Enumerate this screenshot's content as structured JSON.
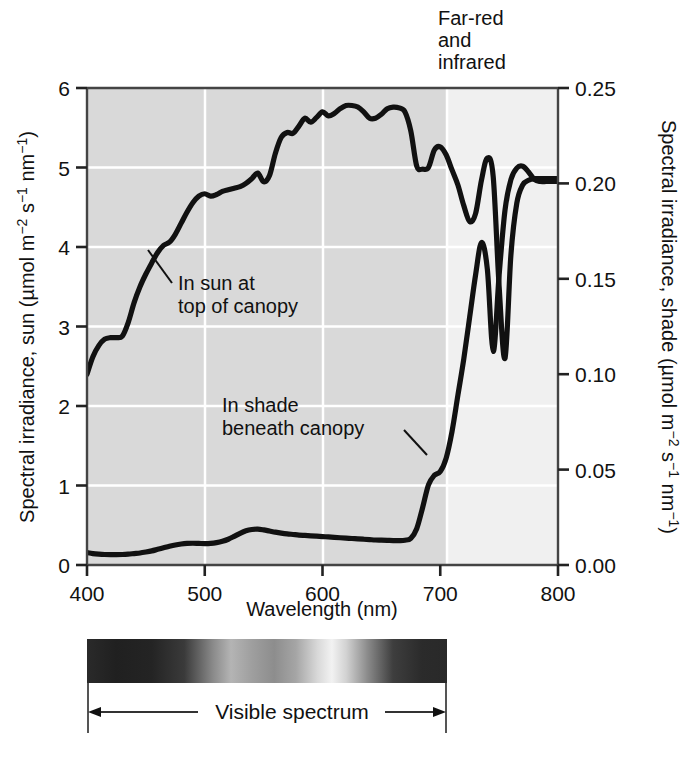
{
  "figure": {
    "background_color": "#ffffff",
    "plot_shaded_color": "#d8d8d8",
    "plot_light_color": "#f0f0f0",
    "curve_color": "#111111",
    "gridline_color": "#ffffff",
    "axis_color": "#444444"
  },
  "annotations": {
    "far_red_line1": "Far-red",
    "far_red_line2": "and",
    "far_red_line3": "infrared",
    "sun_label_line1": "In sun at",
    "sun_label_line2": "top of canopy",
    "shade_label_line1": "In shade",
    "shade_label_line2": "beneath canopy",
    "visible_spectrum_label": "Visible spectrum"
  },
  "axis_titles": {
    "x": "Wavelength (nm)",
    "y_left_main": "Spectral irradiance, sun (µmol m",
    "y_left_sup1": "−2",
    "y_left_mid": " s",
    "y_left_sup2": "−1",
    "y_left_mid2": " nm",
    "y_left_sup3": "−1",
    "y_left_end": ")",
    "y_right_main": "Spectral irradiance, shade (µmol m",
    "y_right_sup1": "−2",
    "y_right_mid": " s",
    "y_right_sup2": "−1",
    "y_right_mid2": " nm",
    "y_right_sup3": "−1",
    "y_right_end": ")"
  },
  "chart_data": {
    "type": "line",
    "title": "",
    "xlabel": "Wavelength (nm)",
    "ylabel": "Spectral irradiance, sun (µmol m−2 s−1 nm−1)",
    "ylabel_right": "Spectral irradiance, shade (µmol m−2 s−1 nm−1)",
    "grid": true,
    "legend_position": "inline-annotations",
    "xlim": [
      400,
      800
    ],
    "xticks": [
      400,
      500,
      600,
      700,
      800
    ],
    "xtick_labels": [
      "400",
      "500",
      "600",
      "700",
      "800"
    ],
    "ylim_left": [
      0,
      6
    ],
    "yticks_left": [
      0,
      1,
      2,
      3,
      4,
      5,
      6
    ],
    "ytick_labels_left": [
      "0",
      "1",
      "2",
      "3",
      "4",
      "5",
      "6"
    ],
    "ylim_right": [
      0.0,
      0.25
    ],
    "yticks_right": [
      0.0,
      0.05,
      0.1,
      0.15,
      0.2,
      0.25
    ],
    "ytick_labels_right": [
      "0.00",
      "0.05",
      "0.10",
      "0.15",
      "0.20",
      "0.25"
    ],
    "shaded_region": {
      "label": "Visible spectrum",
      "x_start": 400,
      "x_end": 700
    },
    "series": [
      {
        "name": "In sun at top of canopy",
        "axis": "left",
        "units": "µmol m−2 s−1 nm−1",
        "x": [
          400,
          405,
          410,
          415,
          420,
          425,
          430,
          435,
          440,
          445,
          450,
          455,
          460,
          465,
          470,
          475,
          480,
          485,
          490,
          495,
          500,
          505,
          510,
          515,
          520,
          525,
          530,
          535,
          540,
          545,
          550,
          555,
          560,
          565,
          570,
          575,
          580,
          585,
          590,
          595,
          600,
          605,
          610,
          615,
          620,
          625,
          630,
          635,
          640,
          645,
          650,
          655,
          660,
          665,
          670,
          675,
          680,
          685,
          690,
          695,
          700,
          705,
          710,
          715,
          720,
          725,
          730,
          735,
          740,
          745,
          750,
          755,
          760,
          765,
          770,
          775,
          780,
          785,
          790,
          795,
          800
        ],
        "y": [
          2.4,
          2.62,
          2.76,
          2.84,
          2.86,
          2.86,
          2.88,
          3.05,
          3.3,
          3.5,
          3.66,
          3.8,
          3.93,
          4.02,
          4.06,
          4.16,
          4.3,
          4.44,
          4.56,
          4.64,
          4.67,
          4.64,
          4.66,
          4.7,
          4.72,
          4.74,
          4.76,
          4.8,
          4.86,
          4.93,
          4.82,
          4.9,
          5.18,
          5.38,
          5.44,
          5.43,
          5.52,
          5.62,
          5.57,
          5.63,
          5.7,
          5.65,
          5.68,
          5.74,
          5.78,
          5.78,
          5.76,
          5.7,
          5.62,
          5.62,
          5.67,
          5.74,
          5.76,
          5.75,
          5.7,
          5.46,
          5.02,
          4.98,
          5.0,
          5.22,
          5.26,
          5.16,
          4.97,
          4.78,
          4.52,
          4.32,
          4.42,
          4.84,
          5.12,
          4.88,
          3.5,
          2.6,
          3.9,
          4.55,
          4.78,
          4.84,
          4.86,
          4.86,
          4.86,
          4.86,
          4.86
        ]
      },
      {
        "name": "In shade beneath canopy",
        "axis": "right",
        "units": "µmol m−2 s−1 nm−1",
        "x": [
          400,
          405,
          410,
          415,
          420,
          425,
          430,
          435,
          440,
          445,
          450,
          455,
          460,
          465,
          470,
          475,
          480,
          485,
          490,
          495,
          500,
          505,
          510,
          515,
          520,
          525,
          530,
          535,
          540,
          545,
          550,
          555,
          560,
          565,
          570,
          575,
          580,
          585,
          590,
          595,
          600,
          605,
          610,
          615,
          620,
          625,
          630,
          635,
          640,
          645,
          650,
          655,
          660,
          665,
          670,
          675,
          680,
          685,
          690,
          695,
          700,
          705,
          710,
          715,
          720,
          725,
          730,
          735,
          740,
          745,
          750,
          755,
          760,
          765,
          770,
          775,
          780,
          785,
          790,
          795,
          800
        ],
        "y": [
          0.0065,
          0.006,
          0.0057,
          0.0055,
          0.0054,
          0.0054,
          0.0055,
          0.0057,
          0.006,
          0.0063,
          0.0068,
          0.0074,
          0.0082,
          0.009,
          0.0098,
          0.0105,
          0.011,
          0.0113,
          0.0114,
          0.0113,
          0.0112,
          0.0113,
          0.0117,
          0.0124,
          0.0135,
          0.015,
          0.0166,
          0.0179,
          0.0186,
          0.0188,
          0.0184,
          0.0178,
          0.0172,
          0.0167,
          0.0163,
          0.016,
          0.0157,
          0.0155,
          0.0153,
          0.0151,
          0.0149,
          0.0147,
          0.0145,
          0.0143,
          0.0141,
          0.0139,
          0.0137,
          0.0135,
          0.0133,
          0.0131,
          0.013,
          0.0129,
          0.0128,
          0.0128,
          0.013,
          0.014,
          0.019,
          0.03,
          0.042,
          0.047,
          0.049,
          0.056,
          0.07,
          0.089,
          0.108,
          0.13,
          0.152,
          0.169,
          0.155,
          0.112,
          0.152,
          0.186,
          0.202,
          0.208,
          0.209,
          0.206,
          0.202,
          0.201,
          0.201,
          0.201,
          0.201
        ]
      }
    ]
  }
}
